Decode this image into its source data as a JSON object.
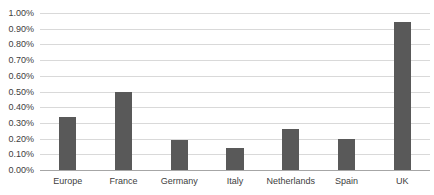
{
  "chart_data": {
    "type": "bar",
    "title": "",
    "subtitle": "",
    "xlabel": "",
    "ylabel": "",
    "categories": [
      "Europe",
      "France",
      "Germany",
      "Italy",
      "Netherlands",
      "Spain",
      "UK"
    ],
    "values": [
      0.34,
      0.5,
      0.19,
      0.14,
      0.26,
      0.2,
      0.94
    ],
    "value_unit": "%",
    "ylim": [
      0.0,
      1.0
    ],
    "ytick_step": 0.1,
    "ytick_labels": [
      "0.00%",
      "0.10%",
      "0.20%",
      "0.30%",
      "0.40%",
      "0.50%",
      "0.60%",
      "0.70%",
      "0.80%",
      "0.90%",
      "1.00%"
    ],
    "ytick_values": [
      0.0,
      0.1,
      0.2,
      0.3,
      0.4,
      0.5,
      0.6,
      0.7,
      0.8,
      0.9,
      1.0
    ],
    "grid": true,
    "grid_axis": "y",
    "legend": false,
    "legend_position": "none",
    "series": [
      {
        "name": "",
        "values": [
          0.34,
          0.5,
          0.19,
          0.14,
          0.26,
          0.2,
          0.94
        ]
      }
    ],
    "colors": {
      "bar_fill": "#595959",
      "gridline": "#d9d9d9",
      "axis_line": "#a6a6a6",
      "tick_label": "#404040",
      "background": "#ffffff"
    }
  }
}
